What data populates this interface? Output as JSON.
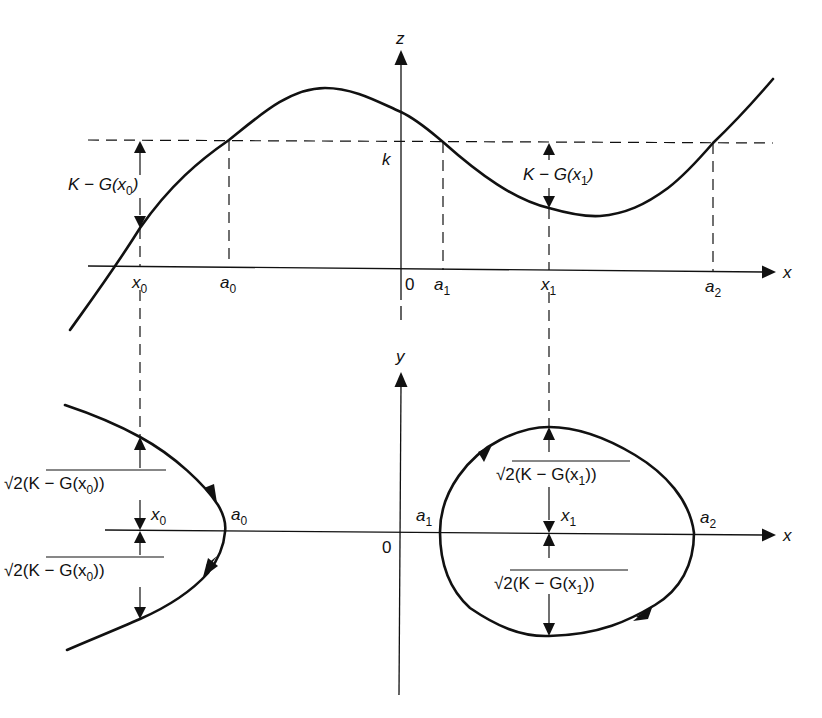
{
  "figure": {
    "colors": {
      "ink": "#111111",
      "background": "#ffffff"
    }
  },
  "top_panel": {
    "axes": {
      "x_label": "x",
      "z_label": "z",
      "origin_label": "0"
    },
    "level_label": "k",
    "x_ticks": [
      {
        "name": "x",
        "sub": "0"
      },
      {
        "name": "a",
        "sub": "0"
      },
      {
        "name": "a",
        "sub": "1"
      },
      {
        "name": "x",
        "sub": "1"
      },
      {
        "name": "a",
        "sub": "2"
      }
    ],
    "measures": [
      {
        "text_main": "K − G(x",
        "text_sub": "0",
        "text_end": ")"
      },
      {
        "text_main": "K − G(x",
        "text_sub": "1",
        "text_end": ")"
      }
    ]
  },
  "bottom_panel": {
    "axes": {
      "x_label": "x",
      "y_label": "y",
      "origin_label": "0"
    },
    "points": [
      {
        "name": "x",
        "sub": "0"
      },
      {
        "name": "a",
        "sub": "0"
      },
      {
        "name": "a",
        "sub": "1"
      },
      {
        "name": "x",
        "sub": "1"
      },
      {
        "name": "a",
        "sub": "2"
      }
    ],
    "measures": [
      {
        "radical": "√",
        "text_main": "2(K − G(x",
        "text_sub": "0",
        "text_end": "))"
      },
      {
        "radical": "√",
        "text_main": "2(K − G(x",
        "text_sub": "0",
        "text_end": "))"
      },
      {
        "radical": "√",
        "text_main": "2(K − G(x",
        "text_sub": "1",
        "text_end": "))"
      },
      {
        "radical": "√",
        "text_main": "2(K − G(x",
        "text_sub": "1",
        "text_end": "))"
      }
    ],
    "orbits": [
      {
        "name": "open-orbit-left",
        "type": "unbounded",
        "turning_point": "a0"
      },
      {
        "name": "closed-orbit-right",
        "type": "periodic",
        "turning_points": [
          "a1",
          "a2"
        ],
        "direction": "clockwise"
      }
    ]
  }
}
